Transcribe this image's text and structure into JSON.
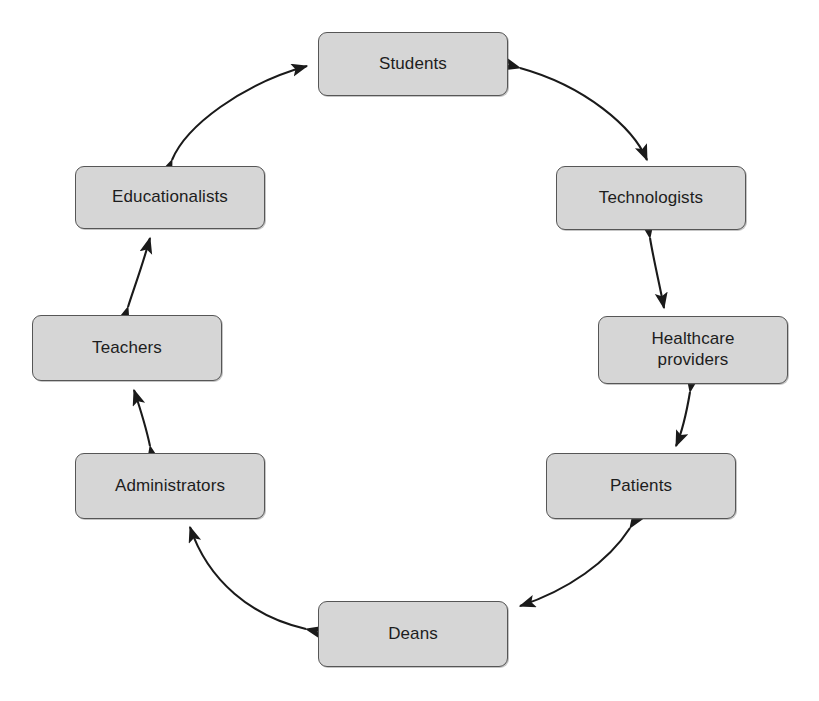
{
  "diagram": {
    "type": "cycle",
    "shape": "ring",
    "background_color": "#ffffff",
    "node_fill_color": "#d6d6d6",
    "node_border_color": "#565656",
    "text_color": "#1d1d1d",
    "arrow_color": "#1a1a1a",
    "nodes": [
      {
        "id": "students",
        "label": "Students",
        "x": 318,
        "y": 32,
        "width": 190,
        "height": 64,
        "position": "top"
      },
      {
        "id": "technologists",
        "label": "Technologists",
        "x": 556,
        "y": 166,
        "width": 190,
        "height": 64,
        "position": "upper-right"
      },
      {
        "id": "healthcare-providers",
        "label": "Healthcare\nproviders",
        "x": 598,
        "y": 316,
        "width": 190,
        "height": 68,
        "position": "right"
      },
      {
        "id": "patients",
        "label": "Patients",
        "x": 546,
        "y": 453,
        "width": 190,
        "height": 66,
        "position": "lower-right"
      },
      {
        "id": "deans",
        "label": "Deans",
        "x": 318,
        "y": 601,
        "width": 190,
        "height": 66,
        "position": "bottom"
      },
      {
        "id": "administrators",
        "label": "Administrators",
        "x": 75,
        "y": 453,
        "width": 190,
        "height": 66,
        "position": "lower-left"
      },
      {
        "id": "teachers",
        "label": "Teachers",
        "x": 32,
        "y": 315,
        "width": 190,
        "height": 66,
        "position": "left"
      },
      {
        "id": "educationalists",
        "label": "Educationalists",
        "x": 75,
        "y": 166,
        "width": 190,
        "height": 63,
        "position": "upper-left"
      }
    ],
    "connections": [
      {
        "id": "students-technologists",
        "from": "students",
        "to": "technologists",
        "style": "curved",
        "heads": "both"
      },
      {
        "id": "technologists-healthcare-providers",
        "from": "technologists",
        "to": "healthcare-providers",
        "style": "straight",
        "heads": "both"
      },
      {
        "id": "healthcare-providers-patients",
        "from": "healthcare-providers",
        "to": "patients",
        "style": "straight",
        "heads": "both"
      },
      {
        "id": "patients-deans",
        "from": "patients",
        "to": "deans",
        "style": "curved",
        "heads": "both"
      },
      {
        "id": "deans-administrators",
        "from": "deans",
        "to": "administrators",
        "style": "curved",
        "heads": "both"
      },
      {
        "id": "administrators-teachers",
        "from": "administrators",
        "to": "teachers",
        "style": "straight",
        "heads": "both"
      },
      {
        "id": "teachers-educationalists",
        "from": "teachers",
        "to": "educationalists",
        "style": "straight",
        "heads": "both"
      },
      {
        "id": "educationalists-students",
        "from": "educationalists",
        "to": "students",
        "style": "curved",
        "heads": "both"
      }
    ]
  }
}
